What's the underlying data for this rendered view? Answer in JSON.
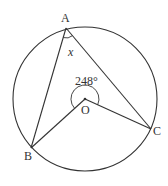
{
  "diagram": {
    "type": "circle-geometry",
    "points": {
      "A": {
        "label": "A",
        "x": 66,
        "y": 28
      },
      "B": {
        "label": "B",
        "x": 31,
        "y": 148
      },
      "C": {
        "label": "C",
        "x": 151,
        "y": 129
      },
      "O": {
        "label": "O",
        "x": 85,
        "y": 99
      }
    },
    "circle": {
      "cx": 85,
      "cy": 99,
      "r": 72
    },
    "angle_labels": {
      "reflex_BOC": "248°",
      "BAC": "x"
    },
    "colors": {
      "stroke": "#333333",
      "background": "#ffffff"
    }
  }
}
